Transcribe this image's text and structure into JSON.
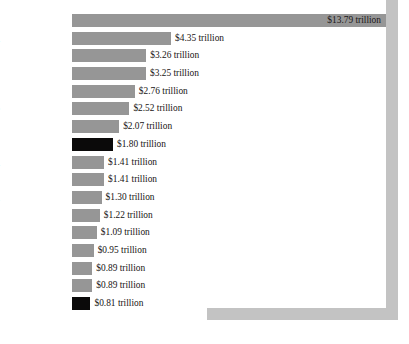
{
  "chart_data": {
    "type": "bar",
    "orientation": "horizontal",
    "title": "",
    "subtitle": "",
    "xlabel": "",
    "ylabel": "",
    "unit": "trillion",
    "currency": "$",
    "xlim": [
      0,
      13.79
    ],
    "grid": false,
    "legend": null,
    "footnote": "",
    "categories": [
      "U.S.",
      "Japan",
      "Germany",
      "China",
      "UK",
      "France",
      "Italy",
      "California",
      "Spain",
      "Canada",
      "Brazil",
      "Russia",
      "India",
      "Korea",
      "Australia",
      "Mexico",
      "Los Angeles*"
    ],
    "values": [
      13.79,
      4.35,
      3.26,
      3.25,
      2.76,
      2.52,
      2.07,
      1.8,
      1.41,
      1.41,
      1.3,
      1.22,
      1.09,
      0.95,
      0.89,
      0.89,
      0.81
    ],
    "value_labels": [
      "$13.79 trillion",
      "$4.35 trillion",
      "$3.26 trillion",
      "$3.25 trillion",
      "$2.76 trillion",
      "$2.52 trillion",
      "$2.07 trillion",
      "$1.80 trillion",
      "$1.41 trillion",
      "$1.41 trillion",
      "$1.30 trillion",
      "$1.22 trillion",
      "$1.09 trillion",
      "$0.95 trillion",
      "$0.89 trillion",
      "$0.89 trillion",
      "$0.81 trillion"
    ],
    "highlighted": [
      "California",
      "Los Angeles*"
    ],
    "colors": {
      "bar": "#969696",
      "bar_highlight": "#0b0a0a",
      "frame": "#c3c3c3",
      "text": "#12100f",
      "background": "#ffffff"
    }
  }
}
